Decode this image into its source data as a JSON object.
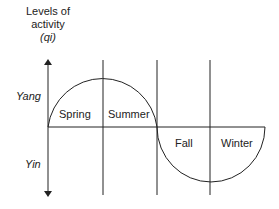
{
  "diagram": {
    "y_axis_title_line1": "Levels of",
    "y_axis_title_line2": "activity",
    "y_axis_title_line3": "(qi)",
    "upper_label": "Yang",
    "lower_label": "Yin",
    "seasons": [
      "Spring",
      "Summer",
      "Fall",
      "Winter"
    ]
  }
}
